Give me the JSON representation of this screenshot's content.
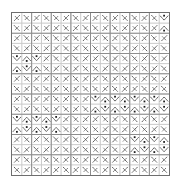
{
  "figure": {
    "title": "",
    "background_color": "#ffffff",
    "frame": {
      "color": "#6e6e6e",
      "line_width": 1,
      "x": 11,
      "y": 12,
      "width": 159,
      "height": 164
    },
    "major_grid": {
      "color": "#8c8c8c",
      "line_width": 1,
      "columns": 8,
      "rows": 8,
      "visible": true
    },
    "minor_grid": {
      "color": "#c8c8c8",
      "line_width": 1,
      "columns": 16,
      "rows": 16,
      "visible": true
    },
    "glyphs": {
      "color": "#4a4a4a",
      "accent_color": "#1a1a1a",
      "style": "diagonal-tick-pair",
      "cells_x": 16,
      "cells_y": 16,
      "description": "Each lattice cell holds short diagonal stroke marks forming X / chevron / arrow motifs"
    }
  },
  "chart_data": {
    "type": "heatmap",
    "title": "",
    "subtitle": "",
    "xlabel": "",
    "ylabel": "",
    "xlim": [
      0,
      16
    ],
    "ylim": [
      0,
      16
    ],
    "grid": true,
    "legend": "none",
    "tick_labels_x": [],
    "tick_labels_y": [],
    "categories": [],
    "values": [],
    "note": "16x16 lattice of orientation glyphs; no numeric axis labels are rendered in the figure",
    "orientations": [
      [
        135,
        45,
        135,
        45,
        45,
        135,
        45,
        135,
        135,
        45,
        135,
        45,
        45,
        135,
        45,
        90
      ],
      [
        45,
        135,
        45,
        135,
        135,
        45,
        135,
        45,
        45,
        135,
        45,
        135,
        135,
        45,
        135,
        270
      ],
      [
        135,
        45,
        135,
        45,
        45,
        135,
        45,
        135,
        135,
        45,
        135,
        45,
        45,
        135,
        45,
        135
      ],
      [
        45,
        135,
        45,
        135,
        135,
        45,
        135,
        45,
        45,
        135,
        45,
        135,
        135,
        45,
        135,
        45
      ],
      [
        90,
        270,
        90,
        135,
        45,
        135,
        45,
        135,
        135,
        45,
        135,
        45,
        45,
        135,
        45,
        135
      ],
      [
        270,
        90,
        270,
        45,
        135,
        45,
        135,
        45,
        45,
        135,
        45,
        135,
        135,
        45,
        135,
        45
      ],
      [
        135,
        45,
        135,
        135,
        45,
        135,
        45,
        135,
        135,
        45,
        135,
        45,
        45,
        135,
        45,
        135
      ],
      [
        45,
        135,
        45,
        45,
        135,
        45,
        135,
        45,
        45,
        135,
        45,
        135,
        135,
        45,
        135,
        45
      ],
      [
        135,
        45,
        135,
        135,
        45,
        135,
        45,
        135,
        90,
        270,
        90,
        270,
        90,
        270,
        90,
        270
      ],
      [
        45,
        135,
        45,
        45,
        135,
        45,
        135,
        45,
        270,
        90,
        270,
        90,
        270,
        90,
        270,
        90
      ],
      [
        90,
        270,
        90,
        270,
        90,
        135,
        45,
        135,
        135,
        45,
        135,
        45,
        45,
        135,
        45,
        135
      ],
      [
        270,
        90,
        270,
        90,
        270,
        45,
        135,
        45,
        45,
        135,
        45,
        135,
        135,
        45,
        135,
        45
      ],
      [
        135,
        45,
        135,
        45,
        45,
        135,
        45,
        135,
        135,
        45,
        135,
        45,
        90,
        270,
        90,
        270
      ],
      [
        45,
        135,
        45,
        135,
        135,
        45,
        135,
        45,
        45,
        135,
        45,
        135,
        270,
        90,
        270,
        90
      ],
      [
        135,
        45,
        135,
        45,
        45,
        135,
        45,
        135,
        135,
        45,
        135,
        45,
        45,
        135,
        45,
        135
      ],
      [
        45,
        135,
        45,
        135,
        135,
        45,
        135,
        45,
        45,
        135,
        45,
        135,
        135,
        45,
        135,
        45
      ]
    ]
  }
}
